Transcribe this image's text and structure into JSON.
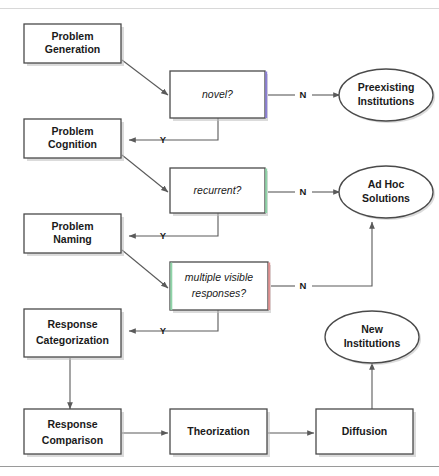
{
  "figure": {
    "type": "flowchart",
    "orientation": "top-to-bottom with right-branching decisions"
  },
  "process_nodes": [
    {
      "id": "problem-generation",
      "line1": "Problem",
      "line2": "Generation"
    },
    {
      "id": "problem-cognition",
      "line1": "Problem",
      "line2": "Cognition"
    },
    {
      "id": "problem-naming",
      "line1": "Problem",
      "line2": "Naming"
    },
    {
      "id": "response-categorization",
      "line1": "Response",
      "line2": "Categorization"
    },
    {
      "id": "response-comparison",
      "line1": "Response",
      "line2": "Comparison"
    },
    {
      "id": "theorization",
      "line1": "Theorization",
      "line2": ""
    },
    {
      "id": "diffusion",
      "line1": "Diffusion",
      "line2": ""
    }
  ],
  "decision_nodes": [
    {
      "id": "novel",
      "line1": "novel?",
      "line2": "",
      "accent_right": "#8b7fd4",
      "accent_left": ""
    },
    {
      "id": "recurrent",
      "line1": "recurrent?",
      "line2": "",
      "accent_right": "#8fd4a8",
      "accent_left": ""
    },
    {
      "id": "multiple-visible-responses",
      "line1": "multiple visible",
      "line2": "responses?",
      "accent_right": "#e09090",
      "accent_left": "#8fd4a8"
    }
  ],
  "terminal_nodes": [
    {
      "id": "preexisting-institutions",
      "line1": "Preexisting",
      "line2": "Institutions"
    },
    {
      "id": "ad-hoc-solutions",
      "line1": "Ad Hoc",
      "line2": "Solutions"
    },
    {
      "id": "new-institutions",
      "line1": "New",
      "line2": "Institutions"
    }
  ],
  "branch_labels": {
    "yes": "Y",
    "no": "N"
  },
  "edges": [
    {
      "from": "problem-generation",
      "to": "novel",
      "label": ""
    },
    {
      "from": "novel",
      "to": "preexisting-institutions",
      "label": "N"
    },
    {
      "from": "novel",
      "to": "problem-cognition",
      "label": "Y"
    },
    {
      "from": "problem-cognition",
      "to": "recurrent",
      "label": ""
    },
    {
      "from": "recurrent",
      "to": "ad-hoc-solutions",
      "label": "N"
    },
    {
      "from": "recurrent",
      "to": "problem-naming",
      "label": "Y"
    },
    {
      "from": "problem-naming",
      "to": "multiple-visible-responses",
      "label": ""
    },
    {
      "from": "multiple-visible-responses",
      "to": "ad-hoc-solutions",
      "label": "N"
    },
    {
      "from": "multiple-visible-responses",
      "to": "response-categorization",
      "label": "Y"
    },
    {
      "from": "response-categorization",
      "to": "response-comparison",
      "label": ""
    },
    {
      "from": "response-comparison",
      "to": "theorization",
      "label": ""
    },
    {
      "from": "theorization",
      "to": "diffusion",
      "label": ""
    },
    {
      "from": "diffusion",
      "to": "new-institutions",
      "label": ""
    }
  ],
  "colors": {
    "stroke": "#4a4a4a",
    "edge": "#5a5a5a",
    "text": "#1a1a1a",
    "background": "#ffffff",
    "shadow": "#bdbdbd"
  }
}
